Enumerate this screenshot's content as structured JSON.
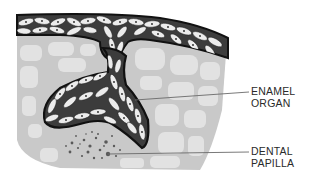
{
  "diagram": {
    "colors": {
      "background": "#ffffff",
      "mesenchyme_fill": "#c9c9c9",
      "mesenchyme_light_cells": "#e4e4e4",
      "epithelium_band": "#3c3c3c",
      "epithelial_cell": "#ececec",
      "outline": "#111111",
      "papilla_dots": "#5a5a5a",
      "leader_line": "#6a6a6a",
      "text": "#2a2a2a"
    },
    "labels": [
      {
        "id": "enamel-organ",
        "lines": [
          "ENAMEL",
          "ORGAN"
        ]
      },
      {
        "id": "dental-papilla",
        "lines": [
          "DENTAL",
          "PAPILLA"
        ]
      }
    ]
  }
}
